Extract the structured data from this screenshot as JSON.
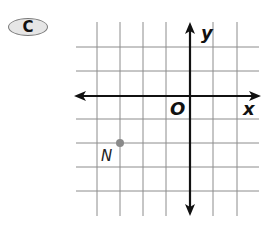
{
  "problem": {
    "label": "C"
  },
  "plane": {
    "x_axis_label": "x",
    "y_axis_label": "y",
    "origin_label": "O",
    "grid_color": "#8c8c8c",
    "axis_color": "#111111",
    "grid": {
      "x_min": -5,
      "x_max": 2,
      "y_min": -4,
      "y_max": 2
    }
  },
  "points": [
    {
      "name": "N",
      "x": -3,
      "y": -2,
      "color": "#8a8a8a"
    }
  ]
}
